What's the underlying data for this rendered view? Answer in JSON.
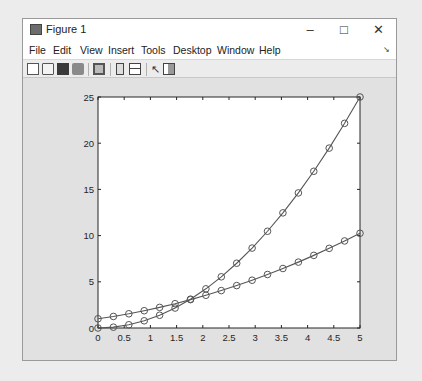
{
  "window": {
    "title": "Figure 1",
    "controls": {
      "minimize": "–",
      "maximize": "□",
      "close": "✕"
    }
  },
  "menubar": {
    "items": [
      "File",
      "Edit",
      "View",
      "Insert",
      "Tools",
      "Desktop",
      "Window",
      "Help"
    ],
    "overflow_icon": "↘"
  },
  "toolbar": {
    "buttons": [
      "new-figure",
      "open-file",
      "save",
      "print",
      "print-preview",
      "toggle-colorbar",
      "insert-legend",
      "edit-plot",
      "property-inspector"
    ]
  },
  "colors": {
    "line": "#555555",
    "marker": "#555555",
    "axes_bg": "#ffffff",
    "figure_bg": "#e1e1e1"
  },
  "chart_data": {
    "type": "line",
    "title": "",
    "xlabel": "",
    "ylabel": "",
    "xlim": [
      0,
      5
    ],
    "ylim": [
      0,
      25
    ],
    "xticks": [
      "0",
      "0.5",
      "1",
      "1.5",
      "2",
      "2.5",
      "3",
      "3.5",
      "4",
      "4.5",
      "5"
    ],
    "yticks": [
      "0",
      "5",
      "10",
      "15",
      "20",
      "25"
    ],
    "grid": false,
    "legend": null,
    "marker": "circle",
    "x": [
      0,
      0.294,
      0.588,
      0.882,
      1.176,
      1.471,
      1.765,
      2.059,
      2.353,
      2.647,
      2.941,
      3.235,
      3.529,
      3.824,
      4.118,
      4.412,
      4.706,
      5.0
    ],
    "series": [
      {
        "name": "series-1",
        "values": [
          0.0,
          0.09,
          0.35,
          0.78,
          1.38,
          2.16,
          3.12,
          4.24,
          5.54,
          7.01,
          8.65,
          10.47,
          12.46,
          14.62,
          16.96,
          19.47,
          22.15,
          25.0
        ]
      },
      {
        "name": "series-2",
        "values": [
          1.0,
          1.25,
          1.54,
          1.87,
          2.23,
          2.63,
          3.07,
          3.54,
          4.05,
          4.59,
          5.17,
          5.79,
          6.44,
          7.13,
          7.86,
          8.62,
          9.42,
          10.25
        ]
      }
    ]
  }
}
